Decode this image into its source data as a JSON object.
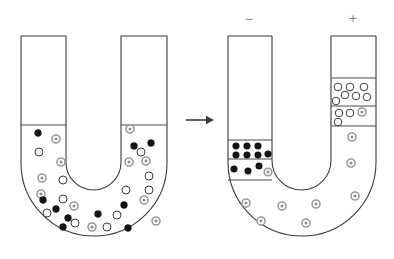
{
  "figure": {
    "arrow": {
      "name": "process-arrow",
      "symbol": "→",
      "x1": 186,
      "x2": 214,
      "y": 120
    },
    "electrodes": [
      {
        "label": "−",
        "polarity": "negative",
        "x": 249,
        "y": 21
      },
      {
        "label": "+",
        "polarity": "positive",
        "x": 353,
        "y": 20
      }
    ],
    "colors": {
      "outline": "#3a3a3a",
      "level_line": "#4a4a4a",
      "particle_black": "#141414",
      "particle_white": "#ffffff",
      "particle_gray_ring": "#9a9a9a",
      "particle_gray_core": "#8e8e8e",
      "label_text": "#6b6b6b",
      "background": "#ffffff"
    },
    "legend_particle_types": [
      {
        "key": "black",
        "description": "solid black particle"
      },
      {
        "key": "white",
        "description": "open white circle particle"
      },
      {
        "key": "gray",
        "description": "gray ringed particle"
      }
    ],
    "tubes": [
      {
        "id": "left-tube",
        "caption": "before electrophoresis — particles mixed uniformly",
        "geometry": {
          "left_outer": 21,
          "left_inner": 66,
          "right_inner": 121,
          "right_outer": 167,
          "top": 36,
          "bottom_outer": 236,
          "bottom_inner": 190,
          "liquid_level_left": 125,
          "liquid_level_right": 125
        },
        "levels": [
          {
            "name": "left-arm-level",
            "x1": 21,
            "x2": 66,
            "y": 125
          },
          {
            "name": "right-arm-level",
            "x1": 121,
            "x2": 167,
            "y": 125
          }
        ],
        "bands": [],
        "particles": [
          {
            "t": "black",
            "x": 38,
            "y": 133,
            "r": 3.4
          },
          {
            "t": "gray",
            "x": 56,
            "y": 139,
            "r": 4.0
          },
          {
            "t": "white",
            "x": 39,
            "y": 152,
            "r": 4.0
          },
          {
            "t": "gray",
            "x": 61,
            "y": 162,
            "r": 4.0
          },
          {
            "t": "gray",
            "x": 42,
            "y": 178,
            "r": 4.0
          },
          {
            "t": "white",
            "x": 63,
            "y": 180,
            "r": 4.0
          },
          {
            "t": "gray",
            "x": 41,
            "y": 194,
            "r": 4.0
          },
          {
            "t": "white",
            "x": 63,
            "y": 199,
            "r": 4.0
          },
          {
            "t": "black",
            "x": 43,
            "y": 200,
            "r": 3.4
          },
          {
            "t": "black",
            "x": 56,
            "y": 209,
            "r": 3.4
          },
          {
            "t": "gray",
            "x": 74,
            "y": 206,
            "r": 4.0
          },
          {
            "t": "white",
            "x": 47,
            "y": 213,
            "r": 4.0
          },
          {
            "t": "black",
            "x": 68,
            "y": 218,
            "r": 3.4
          },
          {
            "t": "white",
            "x": 75,
            "y": 223,
            "r": 4.0
          },
          {
            "t": "black",
            "x": 63,
            "y": 227,
            "r": 3.4
          },
          {
            "t": "gray",
            "x": 92,
            "y": 227,
            "r": 4.0
          },
          {
            "t": "white",
            "x": 107,
            "y": 227,
            "r": 4.0
          },
          {
            "t": "black",
            "x": 98,
            "y": 214,
            "r": 3.4
          },
          {
            "t": "white",
            "x": 117,
            "y": 215,
            "r": 4.0
          },
          {
            "t": "black",
            "x": 124,
            "y": 205,
            "r": 3.4
          },
          {
            "t": "white",
            "x": 126,
            "y": 190,
            "r": 4.0
          },
          {
            "t": "gray",
            "x": 144,
            "y": 200,
            "r": 4.0
          },
          {
            "t": "white",
            "x": 149,
            "y": 190,
            "r": 4.0
          },
          {
            "t": "white",
            "x": 149,
            "y": 176,
            "r": 4.0
          },
          {
            "t": "gray",
            "x": 146,
            "y": 161,
            "r": 4.0
          },
          {
            "t": "gray",
            "x": 129,
            "y": 162,
            "r": 4.0
          },
          {
            "t": "white",
            "x": 141,
            "y": 152,
            "r": 4.0
          },
          {
            "t": "black",
            "x": 151,
            "y": 143,
            "r": 3.4
          },
          {
            "t": "black",
            "x": 134,
            "y": 146,
            "r": 3.4
          },
          {
            "t": "gray",
            "x": 130,
            "y": 129,
            "r": 4.0
          },
          {
            "t": "black",
            "x": 128,
            "y": 228,
            "r": 3.4
          },
          {
            "t": "gray",
            "x": 156,
            "y": 221,
            "r": 4.0
          }
        ]
      },
      {
        "id": "right-tube",
        "caption": "after electrophoresis — particles separated toward electrodes",
        "geometry": {
          "left_outer": 228,
          "left_inner": 272,
          "right_inner": 331,
          "right_outer": 376,
          "top": 36,
          "bottom_outer": 236,
          "bottom_inner": 190,
          "liquid_level_left": 140,
          "liquid_level_right": 78
        },
        "levels": [
          {
            "name": "left-arm-level",
            "x1": 228,
            "x2": 272,
            "y": 140
          },
          {
            "name": "left-arm-band-divider",
            "x1": 228,
            "x2": 272,
            "y": 159
          },
          {
            "name": "left-arm-band-bottom",
            "x1": 228,
            "x2": 272,
            "y": 180
          },
          {
            "name": "right-arm-level",
            "x1": 331,
            "x2": 376,
            "y": 78
          },
          {
            "name": "right-arm-band-divider",
            "x1": 331,
            "x2": 376,
            "y": 106
          },
          {
            "name": "right-arm-band-bottom",
            "x1": 331,
            "x2": 376,
            "y": 126
          }
        ],
        "bands": [
          {
            "name": "black-particle-band-upper",
            "arm": "left",
            "y_top": 140,
            "y_bottom": 159
          },
          {
            "name": "black-particle-band-lower",
            "arm": "left",
            "y_top": 159,
            "y_bottom": 180
          },
          {
            "name": "white-particle-band-upper",
            "arm": "right",
            "y_top": 78,
            "y_bottom": 106
          },
          {
            "name": "white-particle-band-lower",
            "arm": "right",
            "y_top": 106,
            "y_bottom": 126
          }
        ],
        "particles": [
          {
            "t": "black",
            "x": 236,
            "y": 146,
            "r": 3.3
          },
          {
            "t": "black",
            "x": 247,
            "y": 146,
            "r": 3.3
          },
          {
            "t": "black",
            "x": 258,
            "y": 146,
            "r": 3.3
          },
          {
            "t": "black",
            "x": 236,
            "y": 155,
            "r": 3.3
          },
          {
            "t": "black",
            "x": 247,
            "y": 155,
            "r": 3.3
          },
          {
            "t": "black",
            "x": 258,
            "y": 155,
            "r": 3.3
          },
          {
            "t": "black",
            "x": 268,
            "y": 154,
            "r": 3.3
          },
          {
            "t": "black",
            "x": 234,
            "y": 169,
            "r": 3.3
          },
          {
            "t": "black",
            "x": 248,
            "y": 171,
            "r": 3.3
          },
          {
            "t": "black",
            "x": 259,
            "y": 166,
            "r": 3.3
          },
          {
            "t": "gray",
            "x": 268,
            "y": 172,
            "r": 3.8
          },
          {
            "t": "white",
            "x": 338,
            "y": 87,
            "r": 3.8
          },
          {
            "t": "white",
            "x": 350,
            "y": 87,
            "r": 3.8
          },
          {
            "t": "white",
            "x": 364,
            "y": 87,
            "r": 3.8
          },
          {
            "t": "white",
            "x": 345,
            "y": 95,
            "r": 3.8
          },
          {
            "t": "white",
            "x": 356,
            "y": 96,
            "r": 3.8
          },
          {
            "t": "white",
            "x": 367,
            "y": 97,
            "r": 3.8
          },
          {
            "t": "white",
            "x": 336,
            "y": 101,
            "r": 3.8
          },
          {
            "t": "white",
            "x": 339,
            "y": 113,
            "r": 3.8
          },
          {
            "t": "white",
            "x": 350,
            "y": 113,
            "r": 3.8
          },
          {
            "t": "gray",
            "x": 362,
            "y": 112,
            "r": 4.0
          },
          {
            "t": "white",
            "x": 338,
            "y": 122,
            "r": 3.8
          },
          {
            "t": "gray",
            "x": 352,
            "y": 137,
            "r": 4.0
          },
          {
            "t": "gray",
            "x": 351,
            "y": 163,
            "r": 4.0
          },
          {
            "t": "gray",
            "x": 355,
            "y": 196,
            "r": 4.0
          },
          {
            "t": "gray",
            "x": 246,
            "y": 203,
            "r": 4.0
          },
          {
            "t": "gray",
            "x": 282,
            "y": 206,
            "r": 4.0
          },
          {
            "t": "gray",
            "x": 316,
            "y": 204,
            "r": 4.0
          },
          {
            "t": "gray",
            "x": 261,
            "y": 221,
            "r": 4.0
          },
          {
            "t": "gray",
            "x": 306,
            "y": 223,
            "r": 4.0
          }
        ]
      }
    ]
  }
}
